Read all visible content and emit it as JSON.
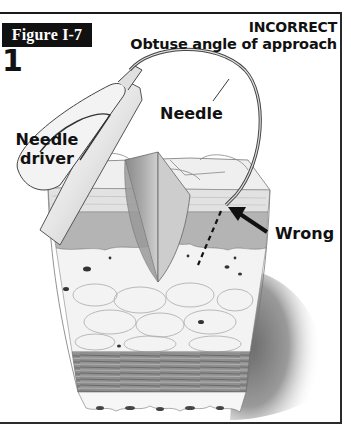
{
  "figure": {
    "label": "Figure I-7",
    "number": "1",
    "title_line1": "INCORRECT",
    "title_line2": "Obtuse angle of approach"
  },
  "callouts": {
    "needle": "Needle",
    "needle_driver_line1": "Needle",
    "needle_driver_line2": "driver",
    "wrong": "Wrong"
  },
  "illustration": {
    "subject": "needle driver passing curved needle into skin cross-section at obtuse angle",
    "layers": [
      "epidermis",
      "dermis",
      "subcutaneous fat",
      "muscle fascia"
    ],
    "icons": [
      "needle-driver-icon",
      "curved-needle-icon",
      "wrong-arrow-icon",
      "dashed-path-icon"
    ]
  },
  "colors": {
    "ink": "#111111",
    "label_bg": "#111111",
    "label_text": "#ffffff",
    "background": "#ffffff"
  }
}
